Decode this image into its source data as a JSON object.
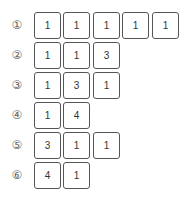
{
  "rows": [
    {
      "label": "①",
      "values": [
        "1",
        "1",
        "1",
        "1",
        "1"
      ]
    },
    {
      "label": "②",
      "values": [
        "1",
        "1",
        "3"
      ]
    },
    {
      "label": "③",
      "values": [
        "1",
        "3",
        "1"
      ]
    },
    {
      "label": "④",
      "values": [
        "1",
        "4"
      ]
    },
    {
      "label": "⑤",
      "values": [
        "3",
        "1",
        "1"
      ]
    },
    {
      "label": "⑥",
      "values": [
        "4",
        "1"
      ]
    }
  ]
}
